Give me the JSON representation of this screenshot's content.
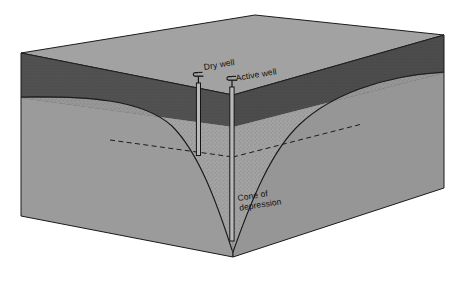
{
  "figure": {
    "kind": "block-diagram",
    "background_color": "#ffffff"
  },
  "labels": {
    "dry_well": "Dry well",
    "active_well": "Active well",
    "cone_line1": "Cone of",
    "cone_line2": "depression"
  },
  "colors": {
    "top_surface": "#a0a0a0",
    "unsaturated_band": "#4d4d4d",
    "front_face": "#9b9b9b",
    "side_face": "#8f8f8f",
    "saturated_zone": "#9b9b9b",
    "stipple": "#bdbdbd",
    "outline": "#1a1a1a",
    "label_text": "#101010",
    "well_casing": "#141414"
  },
  "elements": {
    "dry_well_name": "dry-well",
    "active_well_name": "active-well",
    "water_table_name": "original-water-table",
    "cone_curve_name": "cone-of-depression-curve",
    "pump_icon_name": "hand-pump-icon"
  },
  "geometry": {
    "top_far_apex": [
      255,
      15
    ],
    "top_left_corner": [
      21,
      53
    ],
    "top_right_corner": [
      444,
      35
    ],
    "front_land_apex": [
      233,
      95
    ],
    "bottom_left_corner": [
      21,
      216
    ],
    "bottom_right_corner": [
      444,
      188
    ],
    "bottom_front_apex": [
      233,
      257
    ],
    "dry_well_x": 199,
    "dry_well_top_y": 83,
    "dry_well_bottom_y": 155,
    "active_well_x": 232,
    "active_well_top_y": 87,
    "active_well_bottom_y": 241,
    "water_table_left_y": 98,
    "water_table_depth_at_well": 155
  }
}
